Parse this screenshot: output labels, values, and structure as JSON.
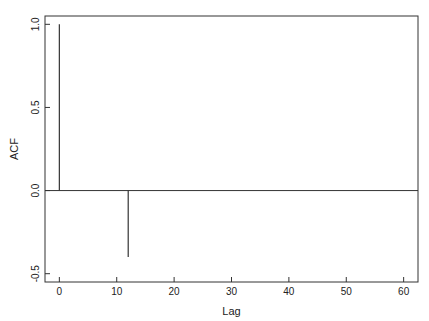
{
  "chart_data": {
    "type": "bar",
    "subtype": "acf-stem",
    "title": "",
    "xlabel": "Lag",
    "ylabel": "ACF",
    "xlim": [
      -2.5,
      62.5
    ],
    "ylim": [
      -0.55,
      1.05
    ],
    "xticks": [
      0,
      10,
      20,
      30,
      40,
      50,
      60
    ],
    "xtick_labels": [
      "0",
      "10",
      "20",
      "30",
      "40",
      "50",
      "60"
    ],
    "yticks": [
      -0.5,
      0.0,
      0.5,
      1.0
    ],
    "ytick_labels": [
      "-0.5",
      "0.0",
      "0.5",
      "1.0"
    ],
    "zero_line": true,
    "grid": false,
    "legend": "none",
    "points": [
      {
        "lag": 0,
        "acf": 1.0
      },
      {
        "lag": 12,
        "acf": -0.4
      }
    ]
  }
}
